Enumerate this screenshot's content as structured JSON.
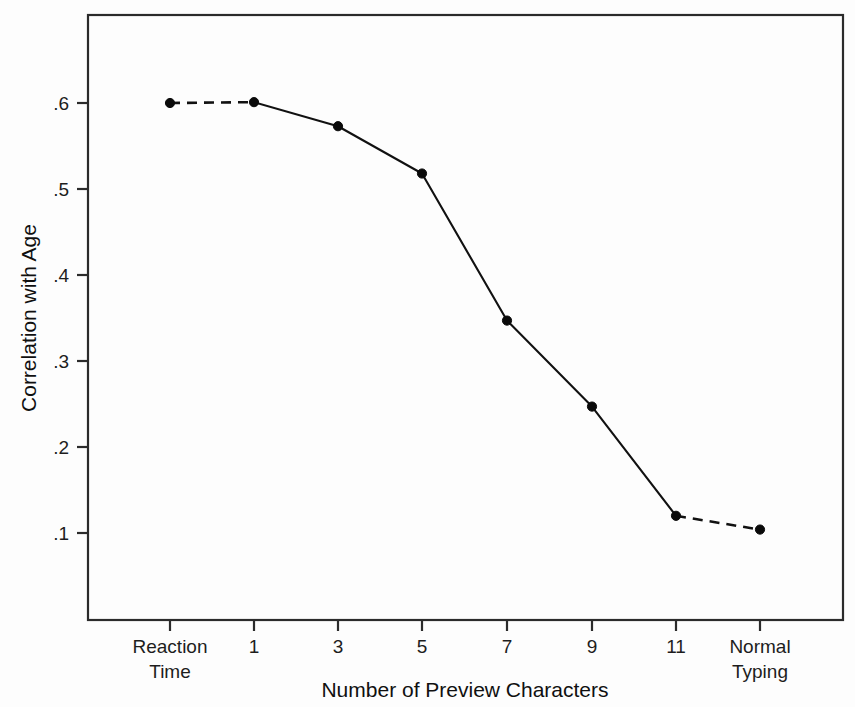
{
  "chart_data": {
    "type": "line",
    "title": "",
    "subtitle": "",
    "xlabel": "Number of Preview Characters",
    "ylabel": "Correlation with Age",
    "categories": [
      "Reaction Time",
      "1",
      "3",
      "5",
      "7",
      "9",
      "11",
      "Normal Typing"
    ],
    "category_labels_multiline": [
      [
        "Reaction",
        "Time"
      ],
      [
        "1"
      ],
      [
        "3"
      ],
      [
        "5"
      ],
      [
        "7"
      ],
      [
        "9"
      ],
      [
        "11"
      ],
      [
        "Normal",
        "Typing"
      ]
    ],
    "values": [
      0.6,
      0.601,
      0.573,
      0.518,
      0.347,
      0.247,
      0.12,
      0.104
    ],
    "series": [
      {
        "name": "Correlation with Age",
        "values": [
          0.6,
          0.601,
          0.573,
          0.518,
          0.347,
          0.247,
          0.12,
          0.104
        ]
      }
    ],
    "segment_styles": [
      "dashed",
      "solid",
      "solid",
      "solid",
      "solid",
      "solid",
      "dashed"
    ],
    "ytick_labels": [
      ".6",
      ".5",
      ".4",
      ".3",
      ".2",
      ".1"
    ],
    "ytick_values": [
      0.6,
      0.5,
      0.4,
      0.3,
      0.2,
      0.1
    ],
    "ylim": [
      0.0,
      0.695
    ],
    "xlim": [
      -0.5,
      7.8
    ],
    "grid": false,
    "legend": false,
    "legend_position": "none",
    "marker_style": "filled-circle",
    "line_color": "#111111",
    "frame_color": "#2b2b2b",
    "background_color": "#fdfdfd",
    "annotations": []
  },
  "geometry": {
    "plot_left": 88,
    "plot_right": 843,
    "plot_top": 15,
    "plot_bottom": 620,
    "y_at_p6": 103,
    "y_at_p1": 533,
    "x_positions": [
      170,
      254,
      338,
      422,
      507,
      592,
      676,
      760
    ],
    "tick_len": 11
  }
}
